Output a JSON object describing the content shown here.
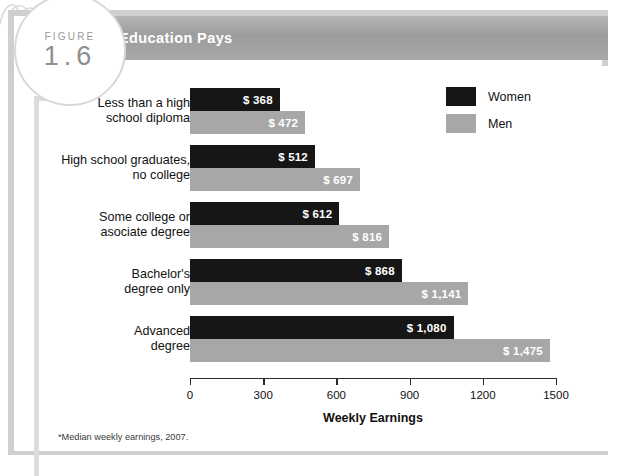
{
  "figure": {
    "word": "FIGURE",
    "number": "1.6"
  },
  "band": {
    "title": "Education Pays"
  },
  "legend": {
    "items": [
      {
        "label": "Women",
        "color": "#161616",
        "key": "women"
      },
      {
        "label": "Men",
        "color": "#a7a7a7",
        "key": "men"
      }
    ]
  },
  "footnote": "*Median weekly earnings, 2007.",
  "chart_data": {
    "type": "bar",
    "orientation": "horizontal",
    "title": "Education Pays",
    "xlabel": "Weekly Earnings",
    "ylabel": "",
    "xlim": [
      0,
      1500
    ],
    "xticks": [
      0,
      300,
      600,
      900,
      1200,
      1500
    ],
    "xticklabels": [
      "0",
      "300",
      "600",
      "900",
      "1200",
      "1500"
    ],
    "grid": false,
    "legend_position": "top-right",
    "categories": [
      "Less than a high\nschool diploma",
      "High school graduates,\nno college",
      "Some college or\nasociate degree",
      "Bachelor's\ndegree only",
      "Advanced\ndegree"
    ],
    "series": [
      {
        "name": "Women",
        "color": "#161616",
        "values": [
          368,
          512,
          612,
          868,
          1080
        ],
        "labels": [
          "$ 368",
          "$ 512",
          "$ 612",
          "$ 868",
          "$ 1,080"
        ]
      },
      {
        "name": "Men",
        "color": "#a7a7a7",
        "values": [
          472,
          697,
          816,
          1141,
          1475
        ],
        "labels": [
          "$ 472",
          "$ 697",
          "$ 816",
          "$ 1,141",
          "$ 1,475"
        ]
      }
    ],
    "annotations": [
      "*Median weekly earnings, 2007."
    ]
  }
}
